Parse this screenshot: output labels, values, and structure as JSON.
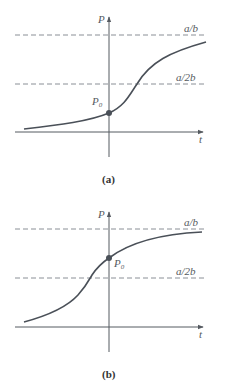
{
  "panels": [
    {
      "id": "a",
      "caption": "(a)",
      "y_axis_label": "P",
      "x_axis_label": "t",
      "upper_asymptote_label": "a/b",
      "mid_line_label": "a/2b",
      "point_label": "P",
      "point_subscript": "0",
      "description": "Logistic curve with P0 below a/2b; inflection occurs at t > 0"
    },
    {
      "id": "b",
      "caption": "(b)",
      "y_axis_label": "P",
      "x_axis_label": "t",
      "upper_asymptote_label": "a/b",
      "mid_line_label": "a/2b",
      "point_label": "P",
      "point_subscript": "0",
      "description": "Logistic curve with P0 between a/2b and a/b; inflection occurs at t < 0"
    }
  ],
  "colors": {
    "axis": "#555a60",
    "dashed": "#8a8f96",
    "curve": "#4a5058"
  }
}
